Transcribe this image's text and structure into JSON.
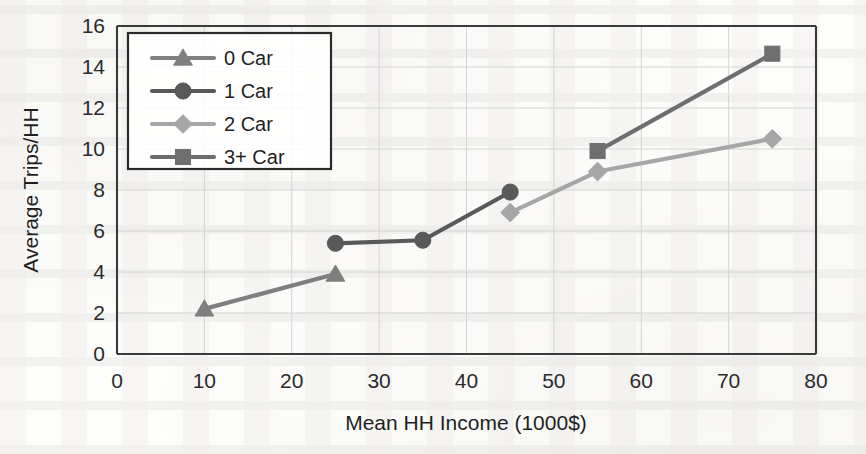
{
  "chart_data": {
    "type": "line",
    "title": "",
    "xlabel": "Mean HH Income (1000$)",
    "ylabel": "Average Trips/HH",
    "xlim": [
      0,
      80
    ],
    "ylim": [
      0,
      16
    ],
    "xticks": [
      "0",
      "10",
      "20",
      "30",
      "40",
      "50",
      "60",
      "70",
      "80"
    ],
    "yticks": [
      "0",
      "2",
      "4",
      "6",
      "8",
      "10",
      "12",
      "14",
      "16"
    ],
    "grid": true,
    "legend_position": "top-left-inside",
    "series": [
      {
        "name": "0 Car",
        "marker": "triangle",
        "color": "#7f7f7f",
        "x": [
          10,
          25
        ],
        "y": [
          2.2,
          3.9
        ]
      },
      {
        "name": "1 Car",
        "marker": "circle",
        "color": "#595959",
        "x": [
          25,
          35,
          45
        ],
        "y": [
          5.4,
          5.55,
          7.9
        ]
      },
      {
        "name": "2 Car",
        "marker": "diamond",
        "color": "#a6a6a6",
        "x": [
          45,
          55,
          75
        ],
        "y": [
          6.9,
          8.9,
          10.5
        ]
      },
      {
        "name": "3+ Car",
        "marker": "square",
        "color": "#6e6e6e",
        "x": [
          55,
          75
        ],
        "y": [
          9.9,
          14.65
        ]
      }
    ]
  },
  "axes": {
    "x_title": "Mean HH Income (1000$)",
    "y_title": "Average Trips/HH",
    "x_tick_labels": [
      "0",
      "10",
      "20",
      "30",
      "40",
      "50",
      "60",
      "70",
      "80"
    ],
    "y_tick_labels": [
      "0",
      "2",
      "4",
      "6",
      "8",
      "10",
      "12",
      "14",
      "16"
    ]
  },
  "legend": {
    "items": [
      {
        "label": "0 Car",
        "marker": "triangle",
        "color": "#7f7f7f"
      },
      {
        "label": "1 Car",
        "marker": "circle",
        "color": "#595959"
      },
      {
        "label": "2 Car",
        "marker": "diamond",
        "color": "#a6a6a6"
      },
      {
        "label": "3+ Car",
        "marker": "square",
        "color": "#6e6e6e"
      }
    ]
  }
}
